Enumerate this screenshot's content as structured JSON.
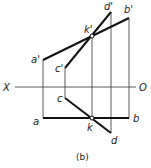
{
  "diagram": {
    "caption": "(b)",
    "axis": {
      "left_label": "X",
      "right_label": "O"
    },
    "points": {
      "a_prime": "a'",
      "b_prime": "b'",
      "c_prime": "c'",
      "d_prime": "d'",
      "k_prime": "k'",
      "a": "a",
      "b": "b",
      "c": "c",
      "d": "d",
      "k": "k"
    },
    "colors": {
      "line": "#111111",
      "thin": "#333333",
      "background": "#ffffff"
    }
  }
}
